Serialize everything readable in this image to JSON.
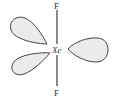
{
  "diagram": {
    "central_atom": "Xe",
    "top_atom": "F",
    "bottom_atom": "F",
    "lone_pairs": 3,
    "colors": {
      "line": "#3a3a3a",
      "lobe_fill": "#ebebeb",
      "lobe_stroke": "#444444",
      "text": "#333333"
    }
  }
}
